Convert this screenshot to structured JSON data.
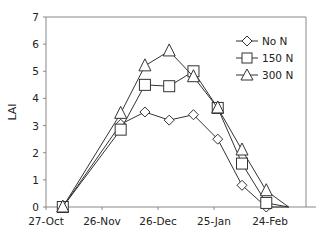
{
  "chart_data": {
    "type": "line",
    "title": "",
    "xlabel": "",
    "ylabel": "LAI",
    "ylim": [
      0,
      7
    ],
    "yticks": [
      0,
      1,
      2,
      3,
      4,
      5,
      6,
      7
    ],
    "xticks": [
      "27-Oct",
      "26-Nov",
      "26-Dec",
      "25-Jan",
      "24-Feb"
    ],
    "x_day_offsets": [
      9,
      40,
      53,
      66,
      79,
      92,
      105,
      118
    ],
    "x_labels_approx": [
      "5-Nov",
      "6-Dec",
      "19-Dec",
      "1-Jan",
      "14-Jan",
      "27-Jan",
      "9-Feb",
      "22-Feb"
    ],
    "grid": false,
    "legend_position": "upper right (inside)",
    "series": [
      {
        "name": "No N",
        "marker": "diamond",
        "values": [
          0,
          3.05,
          3.5,
          3.2,
          3.4,
          2.5,
          0.8,
          0
        ]
      },
      {
        "name": "150 N",
        "marker": "square",
        "values": [
          0,
          2.85,
          4.5,
          4.45,
          5.0,
          3.65,
          1.6,
          0.15
        ]
      },
      {
        "name": "300 N",
        "marker": "triangle",
        "values": [
          0,
          3.45,
          5.2,
          5.75,
          4.8,
          3.65,
          2.1,
          0.6
        ]
      }
    ],
    "end_point": {
      "day_offset": 130,
      "value": 0
    }
  },
  "axis": {
    "y_label": "LAI",
    "y_ticks": [
      "0",
      "1",
      "2",
      "3",
      "4",
      "5",
      "6",
      "7"
    ],
    "x_ticks": [
      "27-Oct",
      "26-Nov",
      "26-Dec",
      "25-Jan",
      "24-Feb"
    ]
  },
  "legend": {
    "items": [
      {
        "label": "No N",
        "marker": "diamond-icon"
      },
      {
        "label": "150 N",
        "marker": "square-icon"
      },
      {
        "label": "300 N",
        "marker": "triangle-icon"
      }
    ]
  }
}
